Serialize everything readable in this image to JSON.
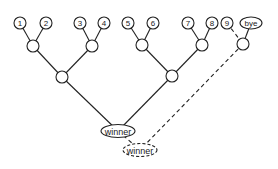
{
  "diagram": {
    "type": "tournament-bracket",
    "players": [
      {
        "id": "p1",
        "label": "1"
      },
      {
        "id": "p2",
        "label": "2"
      },
      {
        "id": "p3",
        "label": "3"
      },
      {
        "id": "p4",
        "label": "4"
      },
      {
        "id": "p5",
        "label": "5"
      },
      {
        "id": "p6",
        "label": "6"
      },
      {
        "id": "p7",
        "label": "7"
      },
      {
        "id": "p8",
        "label": "8"
      },
      {
        "id": "p9",
        "label": "9"
      },
      {
        "id": "bye",
        "label": "bye"
      }
    ],
    "matches": [
      {
        "id": "m12",
        "inputs": [
          "p1",
          "p2"
        ]
      },
      {
        "id": "m34",
        "inputs": [
          "p3",
          "p4"
        ]
      },
      {
        "id": "m56",
        "inputs": [
          "p5",
          "p6"
        ]
      },
      {
        "id": "m78",
        "inputs": [
          "p7",
          "p8"
        ]
      },
      {
        "id": "m9bye",
        "inputs": [
          "p9",
          "bye"
        ],
        "dashed_inputs": [
          "p9"
        ]
      },
      {
        "id": "semi-left",
        "inputs": [
          "m12",
          "m34"
        ]
      },
      {
        "id": "semi-right",
        "inputs": [
          "m56",
          "m78"
        ]
      }
    ],
    "winner": {
      "label": "winner",
      "inputs": [
        "semi-left",
        "semi-right"
      ]
    },
    "final_winner": {
      "label": "winner",
      "inputs": [
        "winner",
        "m9bye"
      ],
      "dashed": true
    }
  }
}
